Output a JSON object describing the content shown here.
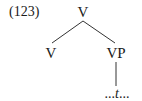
{
  "example": {
    "number": "(123)"
  },
  "tree": {
    "root": {
      "label": "V"
    },
    "children": [
      {
        "label": "V"
      },
      {
        "label": "VP",
        "child": {
          "prefix": "...",
          "trace": "t",
          "suffix": "..."
        }
      }
    ]
  },
  "colors": {
    "line": "#333333",
    "text": "#1a1a1a",
    "background": "#ffffff"
  }
}
